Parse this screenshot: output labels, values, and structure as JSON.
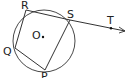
{
  "diagram": {
    "type": "circle-geometry",
    "colors": {
      "stroke": "#333333",
      "background": "#ffffff"
    },
    "circle": {
      "center_label": "O",
      "cx": 44,
      "cy": 41,
      "r": 31
    },
    "points": {
      "R": {
        "label": "R",
        "x": 26,
        "y": 10
      },
      "S": {
        "label": "S",
        "x": 70,
        "y": 20
      },
      "P": {
        "label": "P",
        "x": 45,
        "y": 70
      },
      "Q": {
        "label": "Q",
        "x": 15,
        "y": 48
      },
      "T": {
        "label": "T",
        "x": 111,
        "y": 28
      }
    },
    "labels": {
      "R": "R",
      "S": "S",
      "P": "P",
      "Q": "Q",
      "T": "T",
      "O": "O"
    }
  }
}
